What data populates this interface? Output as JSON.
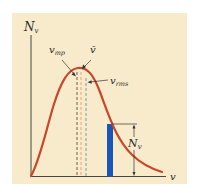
{
  "figure": {
    "background_color": "#f8ebcc",
    "curve_color": "#c8462a",
    "bar_color": "#1a56b8",
    "axis_color": "#333333"
  },
  "axes": {
    "y_label": "N",
    "y_label_sub": "v",
    "x_label": "v"
  },
  "markers": [
    {
      "id": "vmp",
      "label": "v",
      "sub": "mp",
      "color": "#6b4a3a"
    },
    {
      "id": "vbar",
      "label": "v̄",
      "sub": "",
      "color": "#e59a6a"
    },
    {
      "id": "vrms",
      "label": "v",
      "sub": "rms",
      "color": "#7a8aa0"
    }
  ],
  "bar_annotation": {
    "label": "N",
    "sub": "v"
  }
}
